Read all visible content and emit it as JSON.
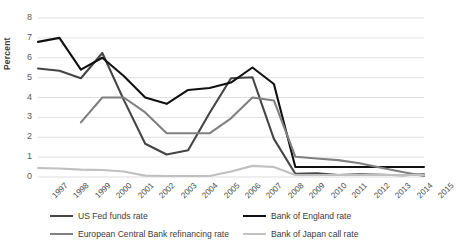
{
  "chart_data": {
    "type": "line",
    "title": "",
    "xlabel": "",
    "ylabel": "Percent",
    "ylim": [
      0,
      8
    ],
    "ytick_values": [
      0,
      1,
      2,
      3,
      4,
      5,
      6,
      7,
      8
    ],
    "grid": true,
    "legend_position": "bottom",
    "categories": [
      "1997",
      "1998",
      "1999",
      "2000",
      "2001",
      "2002",
      "2003",
      "2004",
      "2005",
      "2006",
      "2007",
      "2008",
      "2009",
      "2010",
      "2011",
      "2012",
      "2013",
      "2014",
      "2015"
    ],
    "series": [
      {
        "name": "US Fed funds rate",
        "color": "#454545",
        "values": [
          5.46,
          5.35,
          4.97,
          6.24,
          3.88,
          1.67,
          1.13,
          1.35,
          3.22,
          4.97,
          5.02,
          1.92,
          0.16,
          0.18,
          0.1,
          0.14,
          0.11,
          0.09,
          0.13
        ]
      },
      {
        "name": "Bank of England rate",
        "color": "#111111",
        "values": [
          6.8,
          7.0,
          5.4,
          6.0,
          5.08,
          4.0,
          3.68,
          4.38,
          4.48,
          4.75,
          5.51,
          4.68,
          0.5,
          0.5,
          0.5,
          0.5,
          0.5,
          0.5,
          0.5
        ]
      },
      {
        "name": "European Central Bank refinancing rate",
        "color": "#808080",
        "values": [
          null,
          null,
          2.75,
          4.0,
          4.0,
          3.25,
          2.2,
          2.2,
          2.2,
          2.95,
          4.0,
          3.85,
          1.02,
          0.93,
          0.85,
          0.69,
          0.47,
          0.25,
          0.05
        ]
      },
      {
        "name": "Bank of Japan call rate",
        "color": "#c0c0c0",
        "values": [
          0.45,
          0.43,
          0.37,
          0.35,
          0.28,
          0.07,
          0.05,
          0.05,
          0.05,
          0.28,
          0.56,
          0.5,
          0.1,
          0.1,
          0.1,
          0.1,
          0.1,
          0.1,
          0.1
        ]
      }
    ]
  },
  "legend": {
    "items": [
      {
        "label": "US Fed funds rate",
        "color": "#454545"
      },
      {
        "label": "Bank of England rate",
        "color": "#111111"
      },
      {
        "label": "European Central Bank refinancing rate",
        "color": "#808080"
      },
      {
        "label": "Bank of Japan call rate",
        "color": "#c0c0c0"
      }
    ]
  },
  "axes": {
    "y_title": "Percent"
  }
}
